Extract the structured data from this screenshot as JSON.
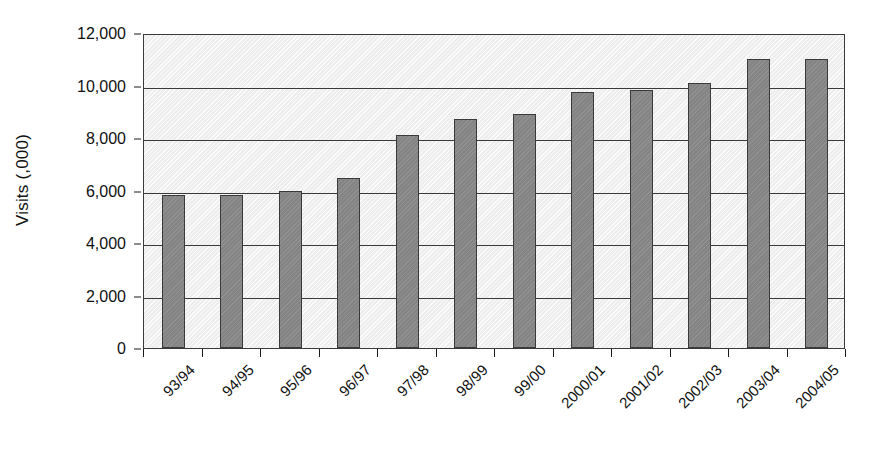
{
  "chart_data": {
    "type": "bar",
    "title": "",
    "xlabel": "",
    "ylabel": "Visits (,000)",
    "ylim": [
      0,
      12000
    ],
    "grid": true,
    "legend": "none",
    "y_ticks": [
      0,
      2000,
      4000,
      6000,
      8000,
      10000,
      12000
    ],
    "y_tick_labels": [
      "0",
      "2,000",
      "4,000",
      "6,000",
      "8,000",
      "10,000",
      "12,000"
    ],
    "categories": [
      "93/94",
      "94/95",
      "95/96",
      "96/97",
      "97/98",
      "98/99",
      "99/00",
      "2000/01",
      "2001/02",
      "2002/03",
      "2003/04",
      "2004/05"
    ],
    "values": [
      5830,
      5830,
      6000,
      6470,
      8120,
      8730,
      8900,
      9760,
      9840,
      10100,
      11000,
      11000
    ],
    "series": [
      {
        "name": "Visits",
        "values": [
          5830,
          5830,
          6000,
          6470,
          8120,
          8730,
          8900,
          9760,
          9840,
          10100,
          11000,
          11000
        ]
      }
    ]
  },
  "style": {
    "bar_fill": "#848484",
    "bar_stroke": "#3a3a3a",
    "plot_background": "#ededed",
    "axis_color": "#1a1a1a",
    "gridline_color": "#3a3a3a"
  }
}
